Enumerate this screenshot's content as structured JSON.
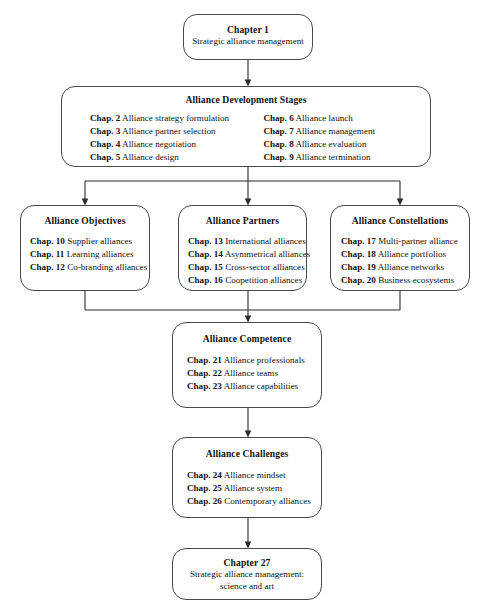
{
  "diagram": {
    "line_color": "#4a4a4a",
    "text_color": "#111111",
    "background": "#ffffff"
  },
  "nodes": {
    "chapter1": {
      "title": "Chapter 1",
      "subtitle": "Strategic alliance management"
    },
    "dev_stages": {
      "title": "Alliance Development Stages",
      "left_column": [
        {
          "ch": "Chap. 2",
          "text": " Alliance strategy formulation"
        },
        {
          "ch": "Chap. 3",
          "text": " Alliance partner selection"
        },
        {
          "ch": "Chap. 4",
          "text": " Alliance negotiation"
        },
        {
          "ch": "Chap. 5",
          "text": " Alliance design"
        }
      ],
      "right_column": [
        {
          "ch": "Chap. 6",
          "text": " Alliance launch"
        },
        {
          "ch": "Chap. 7",
          "text": " Alliance management"
        },
        {
          "ch": "Chap. 8",
          "text": " Alliance evaluation"
        },
        {
          "ch": "Chap. 9",
          "text": " Alliance termination"
        }
      ]
    },
    "objectives": {
      "title": "Alliance Objectives",
      "items": [
        {
          "ch": "Chap. 10",
          "text": " Supplier alliances"
        },
        {
          "ch": "Chap. 11",
          "text": " Learning alliances"
        },
        {
          "ch": "Chap. 12",
          "text": " Co-branding alliances"
        }
      ]
    },
    "partners": {
      "title": "Alliance Partners",
      "items": [
        {
          "ch": "Chap. 13",
          "text": " International alliances"
        },
        {
          "ch": "Chap. 14",
          "text": " Asymmetrical alliances"
        },
        {
          "ch": "Chap. 15",
          "text": " Cross-sector alliances"
        },
        {
          "ch": "Chap. 16",
          "text": " Coopetition alliances"
        }
      ]
    },
    "constellations": {
      "title": "Alliance Constellations",
      "items": [
        {
          "ch": "Chap. 17",
          "text": " Multi-partner alliance"
        },
        {
          "ch": "Chap. 18",
          "text": " Alliance portfolios"
        },
        {
          "ch": "Chap. 19",
          "text": " Alliance networks"
        },
        {
          "ch": "Chap. 20",
          "text": " Business ecosystems"
        }
      ]
    },
    "competence": {
      "title": "Alliance Competence",
      "items": [
        {
          "ch": "Chap. 21",
          "text": " Alliance professionals"
        },
        {
          "ch": "Chap. 22",
          "text": " Alliance teams"
        },
        {
          "ch": "Chap. 23",
          "text": " Alliance capabilities"
        }
      ]
    },
    "challenges": {
      "title": "Alliance Challenges",
      "items": [
        {
          "ch": "Chap. 24",
          "text": " Alliance mindset"
        },
        {
          "ch": "Chap. 25",
          "text": " Alliance system"
        },
        {
          "ch": "Chap. 26",
          "text": " Contemporary alliances"
        }
      ]
    },
    "chapter27": {
      "title": "Chapter 27",
      "subtitle_line1": "Strategic alliance management:",
      "subtitle_line2": "science and art"
    }
  }
}
